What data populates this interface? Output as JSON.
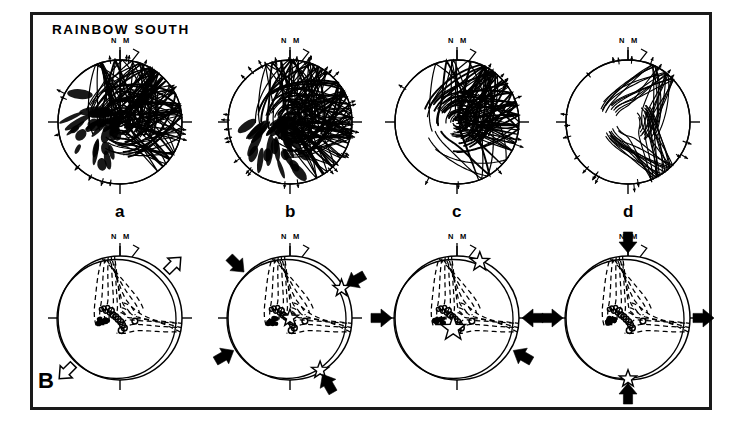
{
  "figure": {
    "title": "RAINBOW SOUTH",
    "panel_label": "B",
    "background_color": "#ffffff",
    "ink_color": "#000000",
    "frame_color": "#1a1a1a",
    "width": 740,
    "height": 428
  },
  "orientation_labels": {
    "true_north": "N",
    "magnetic_north": "M"
  },
  "top_row": {
    "description": "Stereonet plots of fault-plane great circles with slickenline arrows",
    "panels": [
      {
        "id": "a",
        "label": "a",
        "cx": 120,
        "cy": 122,
        "r": 62,
        "density": "very-high",
        "n_circles": 64,
        "seed": 11,
        "style": "great-circles-dense",
        "arrow_ticks": 16
      },
      {
        "id": "b",
        "label": "b",
        "cx": 290,
        "cy": 122,
        "r": 62,
        "density": "very-high",
        "n_circles": 70,
        "seed": 29,
        "style": "great-circles-dense",
        "arrow_ticks": 34
      },
      {
        "id": "c",
        "label": "c",
        "cx": 457,
        "cy": 122,
        "r": 62,
        "density": "high",
        "n_circles": 54,
        "seed": 47,
        "style": "great-circles-dense",
        "arrow_ticks": 12
      },
      {
        "id": "d",
        "label": "d",
        "cx": 628,
        "cy": 122,
        "r": 62,
        "density": "low",
        "n_circles": 26,
        "seed": 73,
        "style": "great-circles-sparse",
        "arrow_ticks": 22
      }
    ],
    "sublabel_y": 208
  },
  "bottom_row": {
    "description": "Stereonet plots of fault-slip inversion: dashed great circles, principal stress axes (open circles), stars, and compression/extension arrows",
    "panels": [
      {
        "id": "Ba",
        "cx": 120,
        "cy": 318,
        "r": 62,
        "arrows": [
          {
            "type": "open",
            "azimuth": 45,
            "direction": "outward",
            "name": "extension-arrow-ne"
          },
          {
            "type": "open",
            "azimuth": 225,
            "direction": "outward",
            "name": "extension-arrow-sw"
          }
        ],
        "stars": [],
        "circles": 14,
        "dashed_girdles": 5
      },
      {
        "id": "Bb",
        "cx": 290,
        "cy": 318,
        "r": 62,
        "arrows": [
          {
            "type": "solid",
            "azimuth": 315,
            "direction": "inward",
            "name": "compression-arrow-nw"
          },
          {
            "type": "solid",
            "azimuth": 60,
            "direction": "inward",
            "name": "compression-arrow-ene"
          },
          {
            "type": "solid",
            "azimuth": 240,
            "direction": "inward",
            "name": "compression-arrow-wsw"
          },
          {
            "type": "solid",
            "azimuth": 150,
            "direction": "inward",
            "name": "compression-arrow-sse"
          }
        ],
        "stars": [
          {
            "azimuth": 60,
            "radius_frac": 0.96,
            "size": 9,
            "name": "stress-star-ene"
          },
          {
            "azimuth": 150,
            "radius_frac": 0.97,
            "size": 9,
            "name": "stress-star-sse"
          },
          {
            "azimuth": 0,
            "radius_frac": 0.0,
            "size": 9,
            "name": "stress-star-center"
          }
        ],
        "circles": 14,
        "dashed_girdles": 5
      },
      {
        "id": "Bc",
        "cx": 457,
        "cy": 318,
        "r": 62,
        "arrows": [
          {
            "type": "solid",
            "azimuth": 270,
            "direction": "inward",
            "name": "compression-arrow-w"
          },
          {
            "type": "solid",
            "azimuth": 120,
            "direction": "inward",
            "name": "compression-arrow-ese"
          },
          {
            "type": "solid",
            "azimuth": 90,
            "direction": "inward",
            "name": "compression-arrow-e"
          }
        ],
        "stars": [
          {
            "azimuth": 22,
            "radius_frac": 0.98,
            "size": 10,
            "name": "stress-star-nne"
          },
          {
            "azimuth": 200,
            "radius_frac": 0.18,
            "size": 13,
            "name": "stress-star-center-large"
          }
        ],
        "circles": 14,
        "dashed_girdles": 5
      },
      {
        "id": "Bd",
        "cx": 628,
        "cy": 318,
        "r": 62,
        "arrows": [
          {
            "type": "solid",
            "azimuth": 0,
            "direction": "inward",
            "name": "compression-arrow-n"
          },
          {
            "type": "solid",
            "azimuth": 180,
            "direction": "inward",
            "name": "compression-arrow-s"
          },
          {
            "type": "solid",
            "azimuth": 270,
            "direction": "inward",
            "name": "compression-arrow-w"
          },
          {
            "type": "solid",
            "azimuth": 90,
            "direction": "outward",
            "name": "extension-arrow-e"
          }
        ],
        "stars": [
          {
            "azimuth": 180,
            "radius_frac": 0.98,
            "size": 9,
            "name": "stress-star-s"
          }
        ],
        "circles": 14,
        "dashed_girdles": 5
      }
    ]
  },
  "data_points": {
    "legend": "open circles = slip/stress axes, trending NE-SW through the net center",
    "cluster_offsets": [
      [
        -0.3,
        0.14
      ],
      [
        -0.26,
        0.16
      ],
      [
        -0.23,
        0.11
      ],
      [
        -0.2,
        0.17
      ],
      [
        -0.17,
        0.08
      ],
      [
        -0.14,
        0.12
      ],
      [
        -0.11,
        0.05
      ],
      [
        -0.07,
        0.02
      ],
      [
        -0.03,
        -0.02
      ],
      [
        0.01,
        -0.06
      ],
      [
        0.04,
        -0.11
      ],
      [
        0.07,
        -0.16
      ],
      [
        0.02,
        -0.2
      ],
      [
        0.24,
        -0.05
      ]
    ]
  }
}
